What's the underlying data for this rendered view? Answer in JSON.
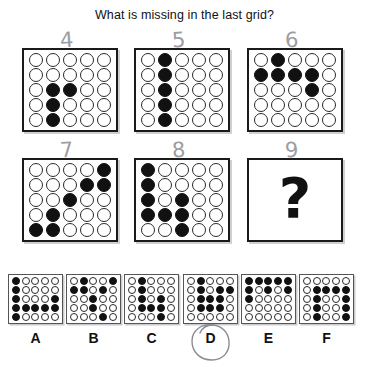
{
  "title": "What is missing in the last grid?",
  "puzzle": {
    "rows": 5,
    "cols": 5,
    "grids": [
      {
        "id": "grid-4",
        "pencil_number": "4",
        "cells": [
          [
            0,
            0,
            0,
            0,
            0
          ],
          [
            0,
            0,
            0,
            0,
            0
          ],
          [
            0,
            1,
            1,
            0,
            0
          ],
          [
            0,
            1,
            0,
            0,
            0
          ],
          [
            0,
            1,
            0,
            0,
            0
          ]
        ]
      },
      {
        "id": "grid-5",
        "pencil_number": "5",
        "cells": [
          [
            0,
            1,
            0,
            0,
            0
          ],
          [
            0,
            1,
            0,
            0,
            0
          ],
          [
            0,
            1,
            0,
            0,
            0
          ],
          [
            0,
            1,
            0,
            0,
            0
          ],
          [
            0,
            1,
            0,
            0,
            0
          ]
        ]
      },
      {
        "id": "grid-6",
        "pencil_number": "6",
        "cells": [
          [
            0,
            1,
            0,
            0,
            0
          ],
          [
            1,
            1,
            1,
            1,
            0
          ],
          [
            0,
            0,
            0,
            1,
            0
          ],
          [
            0,
            0,
            0,
            0,
            0
          ],
          [
            0,
            0,
            0,
            0,
            0
          ]
        ]
      },
      {
        "id": "grid-7",
        "pencil_number": "7",
        "cells": [
          [
            0,
            0,
            0,
            0,
            1
          ],
          [
            0,
            0,
            0,
            1,
            1
          ],
          [
            0,
            0,
            1,
            0,
            0
          ],
          [
            0,
            1,
            0,
            0,
            0
          ],
          [
            1,
            1,
            0,
            0,
            0
          ]
        ]
      },
      {
        "id": "grid-8",
        "pencil_number": "8",
        "cells": [
          [
            1,
            0,
            0,
            0,
            0
          ],
          [
            1,
            0,
            0,
            0,
            0
          ],
          [
            1,
            0,
            1,
            0,
            0
          ],
          [
            1,
            1,
            1,
            0,
            0
          ],
          [
            0,
            0,
            1,
            0,
            0
          ]
        ]
      },
      {
        "id": "grid-9",
        "pencil_number": "9",
        "missing": true,
        "placeholder": "?"
      }
    ]
  },
  "options": [
    {
      "label": "A",
      "cells": [
        [
          1,
          0,
          0,
          0,
          0
        ],
        [
          1,
          0,
          0,
          0,
          0
        ],
        [
          1,
          0,
          0,
          0,
          1
        ],
        [
          1,
          1,
          1,
          1,
          1
        ],
        [
          1,
          0,
          0,
          0,
          0
        ]
      ]
    },
    {
      "label": "B",
      "cells": [
        [
          0,
          1,
          0,
          0,
          1
        ],
        [
          1,
          1,
          0,
          1,
          0
        ],
        [
          0,
          0,
          1,
          0,
          0
        ],
        [
          0,
          0,
          1,
          0,
          0
        ],
        [
          0,
          0,
          0,
          1,
          0
        ]
      ]
    },
    {
      "label": "C",
      "cells": [
        [
          0,
          1,
          0,
          0,
          0
        ],
        [
          0,
          1,
          0,
          0,
          0
        ],
        [
          0,
          1,
          0,
          1,
          0
        ],
        [
          0,
          1,
          1,
          1,
          0
        ],
        [
          0,
          0,
          0,
          1,
          0
        ]
      ]
    },
    {
      "label": "D",
      "selected": true,
      "cells": [
        [
          0,
          1,
          0,
          0,
          0
        ],
        [
          0,
          1,
          0,
          1,
          1
        ],
        [
          0,
          1,
          1,
          1,
          0
        ],
        [
          0,
          1,
          1,
          1,
          0
        ],
        [
          0,
          0,
          0,
          0,
          0
        ]
      ]
    },
    {
      "label": "E",
      "cells": [
        [
          1,
          1,
          1,
          1,
          1
        ],
        [
          1,
          0,
          1,
          0,
          1
        ],
        [
          1,
          0,
          0,
          0,
          0
        ],
        [
          0,
          0,
          0,
          0,
          0
        ],
        [
          0,
          0,
          0,
          0,
          0
        ]
      ]
    },
    {
      "label": "F",
      "cells": [
        [
          0,
          0,
          0,
          0,
          0
        ],
        [
          0,
          1,
          1,
          1,
          1
        ],
        [
          0,
          1,
          0,
          0,
          1
        ],
        [
          0,
          1,
          0,
          0,
          1
        ],
        [
          0,
          1,
          0,
          0,
          1
        ]
      ]
    }
  ],
  "selected_answer": "D",
  "colors": {
    "filled": "#111111",
    "empty": "#ffffff",
    "outline": "#2a2a2a",
    "pencil": "#8c8c93"
  }
}
